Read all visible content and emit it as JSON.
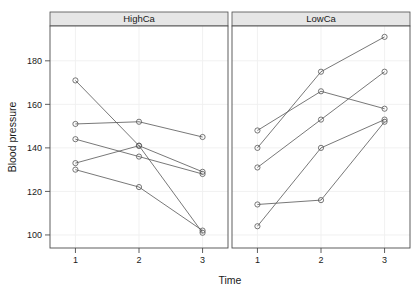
{
  "chart_data": {
    "type": "line",
    "title": "",
    "subtitle": "",
    "xlabel": "Time",
    "ylabel": "Blood pressure",
    "grid": true,
    "legend": null,
    "legend_position": "none",
    "x": [
      1,
      2,
      3
    ],
    "xtick_labels": [
      "1",
      "2",
      "3"
    ],
    "ytick_labels": [
      "100",
      "120",
      "140",
      "160",
      "180"
    ],
    "yticks": [
      100,
      120,
      140,
      160,
      180
    ],
    "xlim": [
      0.6,
      3.4
    ],
    "ylim": [
      94,
      196
    ],
    "marker": "open-circle",
    "line_color": "#555555",
    "marker_color": "#555555",
    "panels": [
      {
        "name": "HighCa",
        "strip_label": "HighCa",
        "series": [
          {
            "name": "subject-1",
            "values": [
              171,
              141,
              101
            ]
          },
          {
            "name": "subject-2",
            "values": [
              151,
              152,
              145
            ]
          },
          {
            "name": "subject-3",
            "values": [
              144,
              136,
              128
            ]
          },
          {
            "name": "subject-4",
            "values": [
              133,
              141,
              129
            ]
          },
          {
            "name": "subject-5",
            "values": [
              130,
              122,
              102
            ]
          }
        ]
      },
      {
        "name": "LowCa",
        "strip_label": "LowCa",
        "series": [
          {
            "name": "subject-6",
            "values": [
              148,
              166,
              158
            ]
          },
          {
            "name": "subject-7",
            "values": [
              140,
              175,
              191
            ]
          },
          {
            "name": "subject-8",
            "values": [
              131,
              153,
              175
            ]
          },
          {
            "name": "subject-9",
            "values": [
              114,
              116,
              152
            ]
          },
          {
            "name": "subject-10",
            "values": [
              104,
              140,
              153
            ]
          }
        ]
      }
    ]
  },
  "axes": {
    "x_title": "Time",
    "y_title": "Blood pressure"
  }
}
